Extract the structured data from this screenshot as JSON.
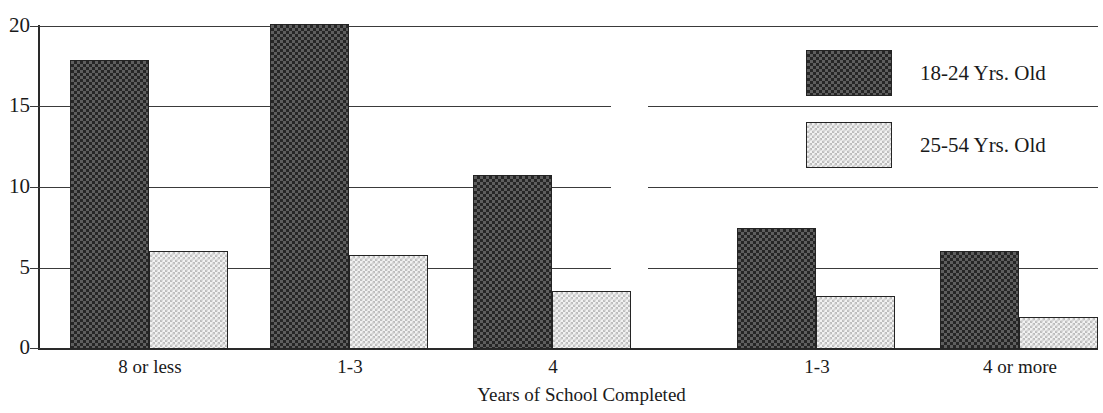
{
  "chart_data": {
    "type": "bar",
    "title": "",
    "xlabel": "Years of School Completed",
    "ylabel": "",
    "ylim": [
      0,
      20
    ],
    "yticks": [
      0,
      5,
      10,
      15,
      20
    ],
    "grid": true,
    "legend_position": "top-right",
    "categories": [
      "8 or less",
      "1-3",
      "4",
      "1-3",
      "4 or more"
    ],
    "series": [
      {
        "name": "18-24 Yrs. Old",
        "values": [
          17.9,
          20.1,
          10.8,
          7.5,
          6.1
        ],
        "pattern": "dark-checker",
        "color": "#4a4a4a"
      },
      {
        "name": "25-54 Yrs. Old",
        "values": [
          6.1,
          5.8,
          3.6,
          3.3,
          2.0
        ],
        "pattern": "light-dotted",
        "color": "#ededed"
      }
    ]
  },
  "axis": {
    "y_ticks": [
      "20",
      "15",
      "10",
      "5",
      "0"
    ],
    "x_title": "Years of School Completed",
    "x_labels": [
      "8 or less",
      "1-3",
      "4",
      "1-3",
      "4 or more"
    ]
  },
  "legend": {
    "items": [
      {
        "label": "18-24 Yrs. Old"
      },
      {
        "label": "25-54 Yrs. Old"
      }
    ]
  },
  "colors": {
    "dark_fill": "#4a4a4a",
    "light_fill": "#ededed",
    "axis": "#2a2a2a",
    "grid": "#3a3a3a",
    "background": "#ffffff"
  }
}
